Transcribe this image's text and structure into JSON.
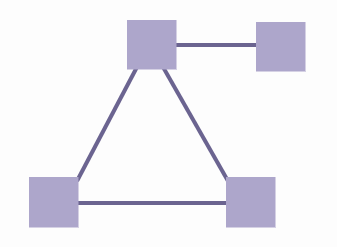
{
  "diagram": {
    "canvas": {
      "width": 337,
      "height": 247,
      "background_color": "#fdfdfd"
    },
    "style": {
      "node_fill_color": "#ada6cb",
      "node_stroke_color": "#ada6cb",
      "edge_color": "#6b6490",
      "edge_width": 4
    },
    "nodes": [
      {
        "id": "top",
        "name": "node-top",
        "label": "",
        "x": 127,
        "y": 20,
        "width": 49,
        "height": 49,
        "fill": "#ada6cb"
      },
      {
        "id": "top-right",
        "name": "node-top-right",
        "label": "",
        "x": 256,
        "y": 22,
        "width": 49,
        "height": 49,
        "fill": "#ada6cb"
      },
      {
        "id": "bottom-left",
        "name": "node-bottom-left",
        "label": "",
        "x": 29,
        "y": 177,
        "width": 49,
        "height": 50,
        "fill": "#ada6cb"
      },
      {
        "id": "bottom-right",
        "name": "node-bottom-right",
        "label": "",
        "x": 226,
        "y": 177,
        "width": 49,
        "height": 50,
        "fill": "#ada6cb"
      }
    ],
    "edges": [
      {
        "id": "edge-top-to-top-right",
        "name": "edge-top-to-top-right",
        "from": "top",
        "to": "top-right",
        "x1": 174,
        "y1": 45,
        "x2": 258,
        "y2": 45,
        "color": "#6b6490",
        "width": 4
      },
      {
        "id": "edge-top-to-bottom-left",
        "name": "edge-top-to-bottom-left",
        "from": "top",
        "to": "bottom-left",
        "x1": 137,
        "y1": 67,
        "x2": 77,
        "y2": 181,
        "color": "#6b6490",
        "width": 4
      },
      {
        "id": "edge-top-to-bottom-right",
        "name": "edge-top-to-bottom-right",
        "from": "top",
        "to": "bottom-right",
        "x1": 163,
        "y1": 67,
        "x2": 228,
        "y2": 181,
        "color": "#6b6490",
        "width": 4
      },
      {
        "id": "edge-bottom-left-to-bottom-right",
        "name": "edge-bottom-left-to-bottom-right",
        "from": "bottom-left",
        "to": "bottom-right",
        "x1": 76,
        "y1": 203,
        "x2": 228,
        "y2": 203,
        "color": "#6b6490",
        "width": 4
      }
    ]
  }
}
